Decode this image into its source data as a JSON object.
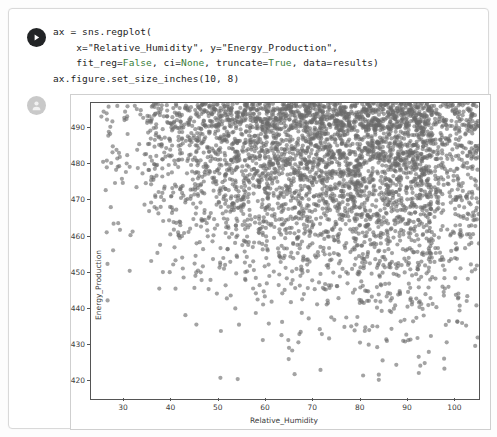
{
  "cell": {
    "run_icon": "play-icon",
    "output_icon": "avatar-icon",
    "code_lines": [
      "ax = sns.regplot(",
      "    x=\"Relative_Humidity\", y=\"Energy_Production\",",
      "    fit_reg=False, ci=None, truncate=True, data=results)",
      "ax.figure.set_size_inches(10, 8)"
    ],
    "code_full": "ax = sns.regplot(\n    x=\"Relative_Humidity\", y=\"Energy_Production\",\n    fit_reg=False, ci=None, truncate=True, data=results)\nax.figure.set_size_inches(10, 8)",
    "keywords": [
      "False",
      "None",
      "True"
    ],
    "keyword_color": "#3a7d3a",
    "code_color": "#1c1c1c"
  },
  "chart_data": {
    "type": "scatter",
    "title": "",
    "xlabel": "Relative_Humidity",
    "ylabel": "Energy_Production",
    "xlim": [
      23,
      105
    ],
    "ylim": [
      415,
      497
    ],
    "xticks": [
      30,
      40,
      50,
      60,
      70,
      80,
      90,
      100
    ],
    "yticks": [
      420,
      430,
      440,
      450,
      460,
      470,
      480,
      490
    ],
    "grid": false,
    "legend": null,
    "marker": {
      "shape": "circle",
      "color": "#6a6a6a",
      "size_px": 4.2,
      "alpha": 0.62
    },
    "n_points": 9500,
    "density_bins": {
      "x_edges": [
        25,
        35,
        45,
        55,
        65,
        75,
        85,
        95,
        105
      ],
      "y_edges": [
        420,
        430,
        440,
        450,
        460,
        470,
        480,
        490,
        497
      ],
      "counts": [
        [
          0,
          0,
          1,
          2,
          3,
          4,
          6,
          3
        ],
        [
          0,
          1,
          3,
          6,
          10,
          14,
          18,
          9
        ],
        [
          1,
          4,
          10,
          18,
          26,
          34,
          40,
          20
        ],
        [
          3,
          12,
          26,
          40,
          52,
          62,
          70,
          34
        ],
        [
          8,
          30,
          58,
          78,
          92,
          104,
          112,
          56
        ],
        [
          14,
          52,
          92,
          120,
          138,
          150,
          158,
          80
        ],
        [
          20,
          70,
          118,
          152,
          172,
          186,
          192,
          96
        ],
        [
          22,
          76,
          128,
          164,
          186,
          200,
          206,
          104
        ]
      ]
    }
  },
  "figure": {
    "width_inches": 10,
    "height_inches": 8,
    "facecolor": "#ffffff",
    "axes_edge_color": "#555555"
  }
}
